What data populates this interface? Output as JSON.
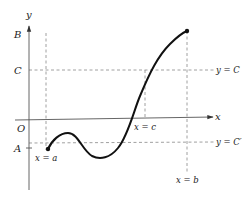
{
  "diagram": {
    "axes": {
      "x_label": "x",
      "y_label": "y",
      "origin_label": "O"
    },
    "y_levels": {
      "B": "B",
      "C": "C",
      "A": "A"
    },
    "guide_labels": {
      "y_eq_C": "y = C",
      "y_eq_C_prime": "y = C′",
      "x_eq_a": "x = a",
      "x_eq_b": "x = b",
      "x_eq_c": "x = c"
    },
    "colors": {
      "curve": "#111111",
      "axes": "#555555",
      "dashed": "#888888",
      "text": "#222222"
    }
  }
}
